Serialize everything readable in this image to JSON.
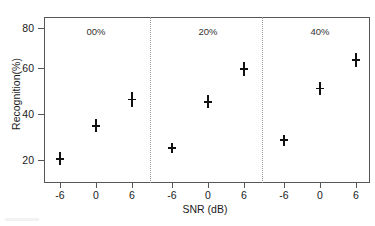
{
  "chart_data": {
    "type": "scatter",
    "title": "",
    "xlabel": "SNR (dB)",
    "ylabel": "Recognition(%)",
    "x": [
      -6,
      0,
      6
    ],
    "xticklabels": [
      "-6",
      "0",
      "6"
    ],
    "yticklabels": [
      "20",
      "40",
      "60",
      "80"
    ],
    "yticks": [
      20,
      40,
      60,
      80
    ],
    "ylim": [
      10,
      88
    ],
    "xlim": [
      -10,
      10
    ],
    "grid": false,
    "legend_position": "none",
    "panels": [
      {
        "label": "00%",
        "values": [
          20.5,
          35.5,
          47.5
        ],
        "errors": [
          3.0,
          3.0,
          3.5
        ]
      },
      {
        "label": "20%",
        "values": [
          25.5,
          46.5,
          61.5
        ],
        "errors": [
          2.2,
          3.0,
          3.2
        ]
      },
      {
        "label": "40%",
        "values": [
          29.0,
          52.5,
          65.5
        ],
        "errors": [
          2.5,
          3.0,
          3.2
        ]
      }
    ],
    "series": [
      {
        "name": "00%",
        "values": [
          20.5,
          35.5,
          47.5
        ]
      },
      {
        "name": "20%",
        "values": [
          25.5,
          46.5,
          61.5
        ]
      },
      {
        "name": "40%",
        "values": [
          29.0,
          52.5,
          65.5
        ]
      }
    ]
  }
}
